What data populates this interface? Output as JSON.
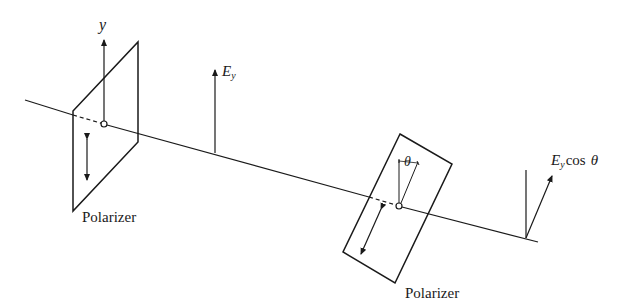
{
  "diagram": {
    "type": "optics-polarization",
    "colors": {
      "ink": "#1a1a1a",
      "background": "#ffffff"
    },
    "labels": {
      "y_axis": "y",
      "field_in": "E",
      "field_in_sub": "y",
      "field_out_E": "E",
      "field_out_sub": "y",
      "field_out_cos": "cos",
      "field_out_theta": "θ",
      "angle": "θ",
      "polarizer_1": "Polarizer",
      "polarizer_2": "Polarizer"
    }
  }
}
